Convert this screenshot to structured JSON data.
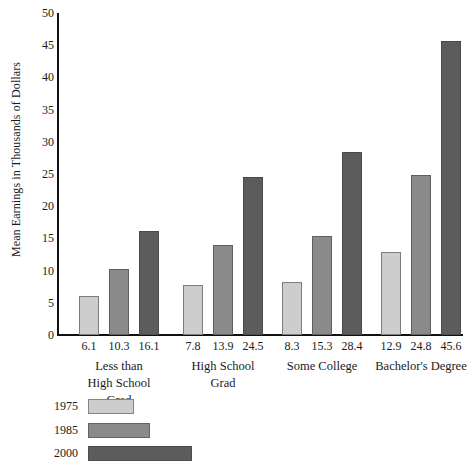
{
  "chart_data": {
    "type": "bar",
    "title": "",
    "xlabel": "",
    "ylabel": "Mean Earnings in Thousands of Dollars",
    "ylim": [
      0,
      50
    ],
    "yticks": [
      0,
      5,
      10,
      15,
      20,
      25,
      30,
      35,
      40,
      45,
      50
    ],
    "ytick_labels": [
      "0",
      "5",
      "10",
      "15",
      "20",
      "25",
      "30",
      "35",
      "40",
      "45",
      "50"
    ],
    "grid": false,
    "legend_position": "below-left",
    "categories": [
      "Less than High School Grad",
      "High School Grad",
      "Some College",
      "Bachelor's Degree"
    ],
    "category_lines": [
      [
        "Less than",
        "High School",
        "Grad"
      ],
      [
        "High School",
        "Grad"
      ],
      [
        "Some College"
      ],
      [
        "Bachelor's Degree"
      ]
    ],
    "series": [
      {
        "name": "1975",
        "color": "#cdcdcd",
        "values": [
          6.1,
          7.8,
          8.3,
          12.9
        ]
      },
      {
        "name": "1985",
        "color": "#8a8a8a",
        "values": [
          10.3,
          13.9,
          15.3,
          24.8
        ]
      },
      {
        "name": "2000",
        "color": "#5c5c5c",
        "values": [
          16.1,
          24.5,
          28.4,
          45.6
        ]
      }
    ],
    "value_labels": [
      [
        "6.1",
        "10.3",
        "16.1"
      ],
      [
        "7.8",
        "13.9",
        "24.5"
      ],
      [
        "8.3",
        "15.3",
        "28.4"
      ],
      [
        "12.9",
        "24.8",
        "45.6"
      ]
    ]
  },
  "legend": {
    "entries": [
      {
        "label": "1975",
        "color": "#cdcdcd",
        "width": 46
      },
      {
        "label": "1985",
        "color": "#8a8a8a",
        "width": 62
      },
      {
        "label": "2000",
        "color": "#5c5c5c",
        "width": 104
      }
    ]
  }
}
